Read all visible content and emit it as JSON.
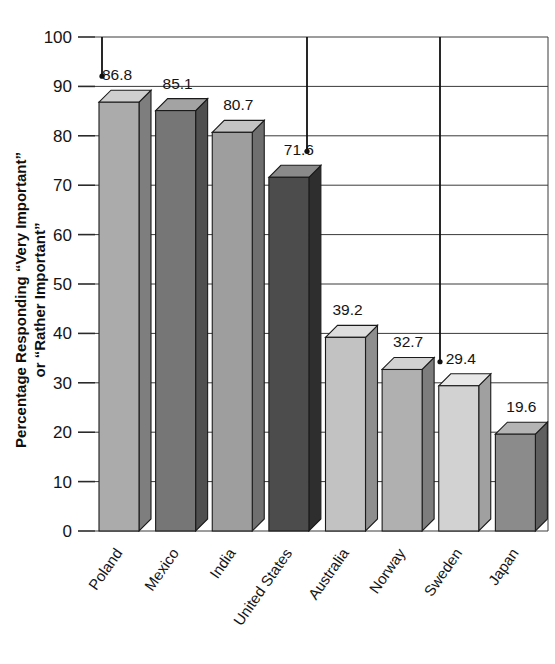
{
  "chart_data": {
    "type": "bar",
    "title": "",
    "subtitle": "",
    "xlabel": "",
    "ylabel": "Percentage Responding “Very Important” or “Rather Important”",
    "ylabel_line1": "Percentage Responding “Very Important”",
    "ylabel_line2": "or “Rather Important”",
    "categories": [
      "Poland",
      "Mexico",
      "India",
      "United States",
      "Australia",
      "Norway",
      "Sweden",
      "Japan"
    ],
    "values": [
      86.8,
      85.1,
      80.7,
      71.6,
      39.2,
      32.7,
      29.4,
      19.6
    ],
    "value_labels": [
      "86.8",
      "85.1",
      "80.7",
      "71.6",
      "39.2",
      "32.7",
      "29.4",
      "19.6"
    ],
    "ylim": [
      0,
      100
    ],
    "ytick_values": [
      0,
      10,
      20,
      30,
      40,
      50,
      60,
      70,
      80,
      90,
      100
    ],
    "ytick_labels": [
      "0",
      "10",
      "20",
      "30",
      "40",
      "50",
      "60",
      "70",
      "80",
      "90",
      "100"
    ],
    "grid": true,
    "legend": false,
    "legend_position": "none",
    "style": "3d-column",
    "bar_face_colors": [
      "#ababab",
      "#767676",
      "#9e9e9e",
      "#4c4c4c",
      "#c2c2c2",
      "#b0b0b0",
      "#d2d2d2",
      "#8b8b8b"
    ],
    "bar_top_colors": [
      "#cfcfcf",
      "#a3a3a3",
      "#c4c4c4",
      "#8a8a8a",
      "#dedede",
      "#d2d2d2",
      "#e8e8e8",
      "#b4b4b4"
    ],
    "bar_side_colors": [
      "#7e7e7e",
      "#4f4f4f",
      "#6f6f6f",
      "#2e2e2e",
      "#8e8e8e",
      "#7d7d7d",
      "#a0a0a0",
      "#5f5f5f"
    ],
    "callouts": [
      {
        "target_label": "86.8",
        "from_value": 100
      },
      {
        "target_label": "71.6",
        "from_value": 100
      },
      {
        "target_label": "29.4",
        "from_value": 100
      }
    ]
  },
  "axis": {
    "y_axis_name": "percentage-axis",
    "x_axis_name": "country-axis"
  }
}
